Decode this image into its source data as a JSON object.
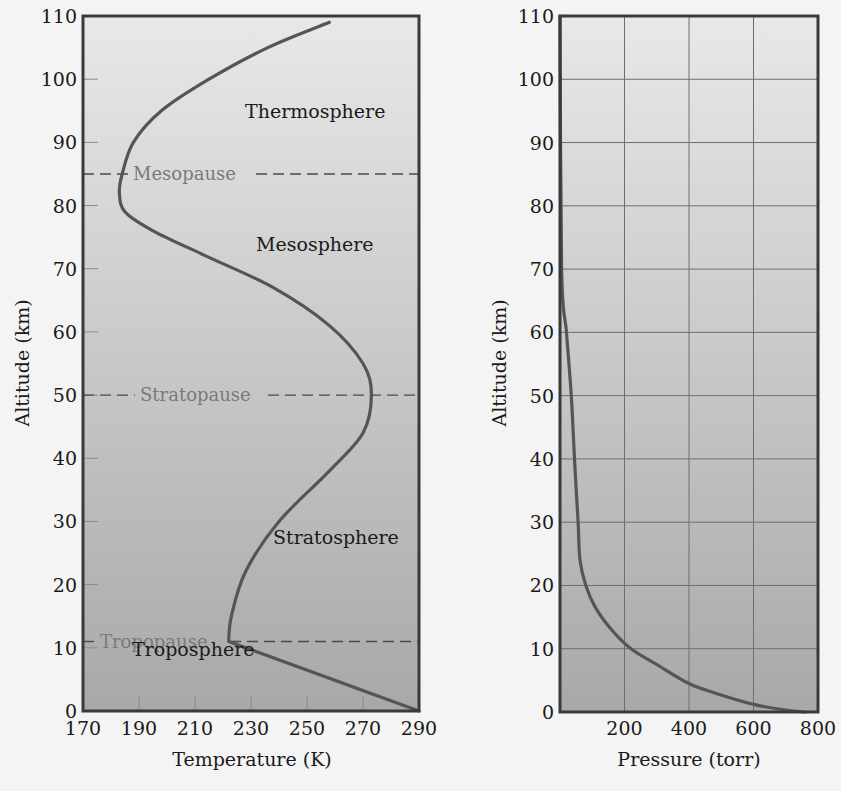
{
  "chart_data": [
    {
      "type": "line",
      "title": "",
      "xlabel": "Temperature (K)",
      "ylabel": "Altitude (km)",
      "xlim": [
        170,
        290
      ],
      "ylim": [
        0,
        110
      ],
      "xticks": [
        170,
        190,
        210,
        230,
        250,
        270,
        290
      ],
      "yticks": [
        0,
        10,
        20,
        30,
        40,
        50,
        60,
        70,
        80,
        90,
        100,
        110
      ],
      "grid": false,
      "series": [
        {
          "name": "Temperature profile",
          "x": [
            290,
            256,
            222,
            223,
            228,
            240,
            258,
            270,
            273,
            270,
            258,
            238,
            214,
            195,
            185,
            183,
            184,
            188,
            198,
            215,
            236,
            258
          ],
          "y": [
            0,
            5.5,
            11,
            15,
            22,
            30,
            38,
            44,
            50,
            55,
            61,
            67,
            72,
            76,
            79,
            82,
            85,
            90,
            95,
            100,
            105,
            109
          ]
        }
      ],
      "reference_lines": [
        {
          "label": "Tropopause",
          "y": 11
        },
        {
          "label": "Stratopause",
          "y": 50
        },
        {
          "label": "Mesopause",
          "y": 85
        }
      ],
      "annotations": [
        {
          "text": "Troposphere",
          "x": 236,
          "y": 5
        },
        {
          "text": "Stratosphere",
          "x": 264,
          "y": 27
        },
        {
          "text": "Mesosphere",
          "x": 258,
          "y": 73
        },
        {
          "text": "Thermosphere",
          "x": 262,
          "y": 94
        }
      ]
    },
    {
      "type": "line",
      "title": "",
      "xlabel": "Pressure (torr)",
      "ylabel": "Altitude (km)",
      "xlim": [
        0,
        800
      ],
      "ylim": [
        0,
        110
      ],
      "xticks": [
        200,
        400,
        600,
        800
      ],
      "yticks": [
        0,
        10,
        20,
        30,
        40,
        50,
        60,
        70,
        80,
        90,
        100,
        110
      ],
      "grid": true,
      "series": [
        {
          "name": "Pressure profile",
          "x": [
            760,
            700,
            600,
            480,
            400,
            300,
            220,
            160,
            110,
            80,
            62,
            56,
            45,
            35,
            20,
            5,
            0
          ],
          "y": [
            0,
            0.3,
            1.2,
            3,
            4.5,
            7.5,
            10,
            13,
            16.5,
            20,
            24,
            30,
            40,
            50,
            60,
            70,
            110
          ]
        }
      ],
      "annotations": []
    }
  ],
  "left_chart": {
    "xlabel": "Temperature (K)",
    "ylabel": "Altitude (km)",
    "xtick_labels": [
      "170",
      "190",
      "210",
      "230",
      "250",
      "270",
      "290"
    ],
    "ytick_labels": [
      "0",
      "10",
      "20",
      "30",
      "40",
      "50",
      "60",
      "70",
      "80",
      "90",
      "100",
      "110"
    ],
    "layers": {
      "troposphere": "Troposphere",
      "stratosphere": "Stratosphere",
      "mesosphere": "Mesosphere",
      "thermosphere": "Thermosphere"
    },
    "pauses": {
      "tropopause": "Tropopause",
      "stratopause": "Stratopause",
      "mesopause": "Mesopause"
    }
  },
  "right_chart": {
    "xlabel": "Pressure (torr)",
    "ylabel": "Altitude (km)",
    "xtick_labels": [
      "200",
      "400",
      "600",
      "800"
    ],
    "ytick_labels": [
      "0",
      "10",
      "20",
      "30",
      "40",
      "50",
      "60",
      "70",
      "80",
      "90",
      "100",
      "110"
    ]
  },
  "colors": {
    "curve": "#555555",
    "frame": "#3a3a3a",
    "pause_label": "#7a7a7a",
    "layer_label": "#1a1a1a",
    "bg_top": "#e8e8e8",
    "bg_bottom": "#a8a8a8",
    "grid": "#6e6e6e"
  }
}
